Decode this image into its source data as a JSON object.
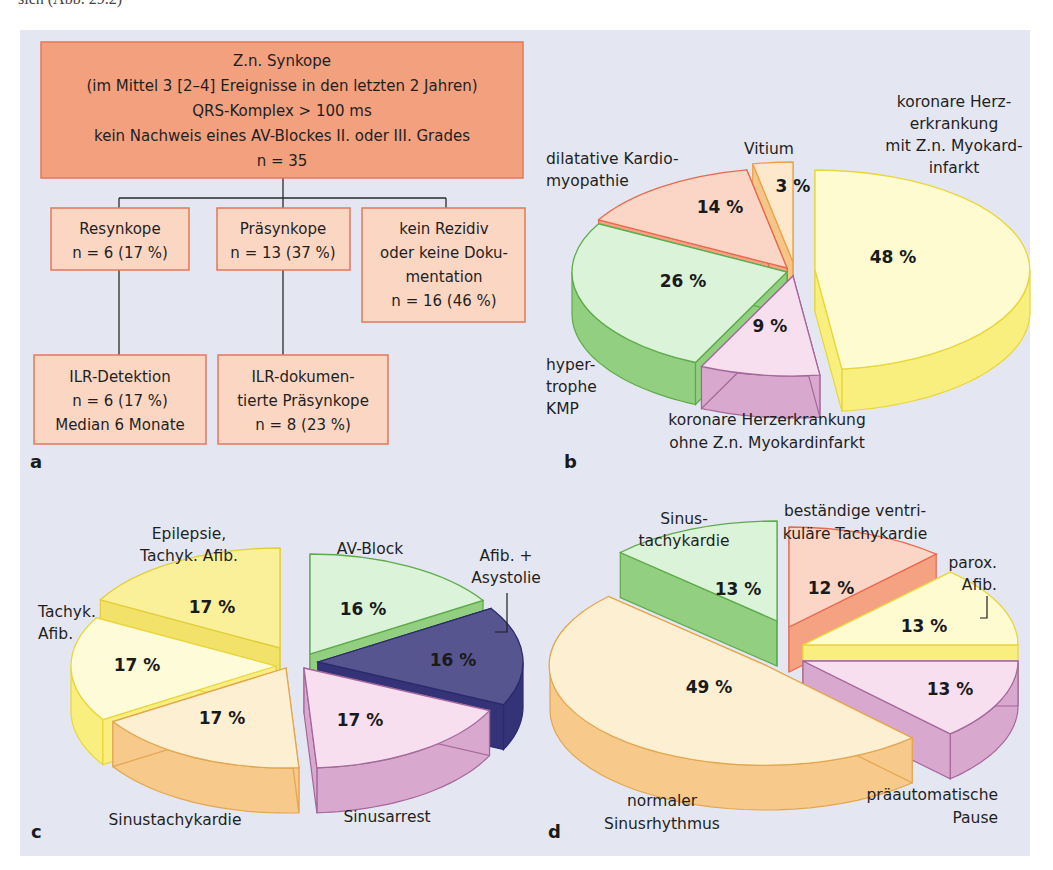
{
  "page": {
    "caption_cut": "sich (Abb. 29.2)"
  },
  "panel_letters": {
    "a": "a",
    "b": "b",
    "c": "c",
    "d": "d"
  },
  "flowchart": {
    "root": {
      "lines": [
        "Z.n. Synkope",
        "(im Mittel 3 [2–4] Ereignisse in den letzten 2 Jahren)",
        "QRS-Komplex > 100 ms",
        "kein Nachweis eines AV-Blockes II. oder III. Grades",
        "n = 35"
      ],
      "fill": "#f2a07e",
      "stroke": "#e2785a"
    },
    "level1": [
      {
        "lines": [
          "Resynkope",
          "n = 6 (17 %)"
        ]
      },
      {
        "lines": [
          "Präsynkope",
          "n = 13 (37 %)"
        ]
      },
      {
        "lines": [
          "kein Rezidiv",
          "oder keine Doku-",
          "mentation",
          "n = 16 (46 %)"
        ]
      }
    ],
    "level2": [
      {
        "lines": [
          "ILR-Detektion",
          "n = 6 (17 %)",
          "Median 6 Monate"
        ]
      },
      {
        "lines": [
          "ILR-dokumen-",
          "tierte Präsynkope",
          "n = 8 (23 %)"
        ]
      }
    ],
    "child_fill": "#fbd6c2",
    "child_stroke": "#e2785a"
  },
  "chart_data": [
    {
      "panel": "b",
      "type": "pie",
      "title": "",
      "unit": "%",
      "categories": [
        "koronare Herzerkrankung mit Z.n. Myokardinfarkt",
        "koronare Herzerkrankung ohne Z.n. Myokardinfarkt",
        "hypertrophe KMP",
        "dilatative Kardiomyopathie",
        "Vitium"
      ],
      "values": [
        48,
        9,
        26,
        14,
        3
      ],
      "labels": [
        [
          "koronare Herz-",
          "erkrankung",
          "mit Z.n. Myokard-",
          "infarkt"
        ],
        [
          "koronare Herzerkrankung",
          "ohne Z.n. Myokardinfarkt"
        ],
        [
          "hyper-",
          "trophe",
          "KMP"
        ],
        [
          "dilatative Kardio-",
          "myopathie"
        ],
        [
          "Vitium"
        ]
      ],
      "colors": {
        "top": [
          "#fdfbcf",
          "#f7dff0",
          "#dbf3d8",
          "#fbd6c6",
          "#fde8cc"
        ],
        "side": [
          "#f8ef7e",
          "#d9a8cf",
          "#93cf80",
          "#f4a282",
          "#f6c588"
        ],
        "stroke": [
          "#e8d63c",
          "#a4679a",
          "#5daa4b",
          "#e76a50",
          "#eaa24c"
        ]
      }
    },
    {
      "panel": "c",
      "type": "pie",
      "title": "",
      "unit": "%",
      "categories": [
        "AV-Block",
        "Afib. + Asystolie",
        "Sinusarrest",
        "Sinustachykardie",
        "Tachyk. Afib.",
        "Epilepsie, Tachyk. Afib."
      ],
      "values": [
        16,
        16,
        17,
        17,
        17,
        17
      ],
      "labels": [
        [
          "AV-Block"
        ],
        [
          "Afib. +",
          "Asystolie"
        ],
        [
          "Sinusarrest"
        ],
        [
          "Sinustachykardie"
        ],
        [
          "Tachyk.",
          "Afib."
        ],
        [
          "Epilepsie,",
          "Tachyk. Afib."
        ]
      ],
      "colors": {
        "top": [
          "#dbf3d8",
          "#56558f",
          "#f7dff0",
          "#fdf0d2",
          "#fefbd8",
          "#fbf09a"
        ],
        "side": [
          "#93cf80",
          "#343378",
          "#d9a8cf",
          "#f7c98a",
          "#f8ef7e",
          "#f3e26a"
        ],
        "stroke": [
          "#5daa4b",
          "#2b2a6b",
          "#a4679a",
          "#e3a650",
          "#e8d63c",
          "#e2cd3a"
        ]
      }
    },
    {
      "panel": "d",
      "type": "pie",
      "title": "",
      "unit": "%",
      "categories": [
        "beständige ventrikuläre Tachykardie",
        "parox. Afib.",
        "präautomatische Pause",
        "normaler Sinusrhythmus",
        "Sinustachykardie"
      ],
      "values": [
        12,
        13,
        13,
        49,
        13
      ],
      "labels": [
        [
          "beständige ventri-",
          "kuläre Tachykardie"
        ],
        [
          "parox.",
          "Afib."
        ],
        [
          "präautomatische",
          "Pause"
        ],
        [
          "normaler",
          "Sinusrhythmus"
        ],
        [
          "Sinus-",
          "tachykardie"
        ]
      ],
      "colors": {
        "top": [
          "#fbd6c6",
          "#fefbd0",
          "#f7dff0",
          "#fdf0d2",
          "#dbf3d8"
        ],
        "side": [
          "#f4a282",
          "#f8ef7e",
          "#d9a8cf",
          "#f7c98a",
          "#93cf80"
        ],
        "stroke": [
          "#e76a50",
          "#e8d63c",
          "#a4679a",
          "#e3a650",
          "#5daa4b"
        ]
      }
    }
  ]
}
